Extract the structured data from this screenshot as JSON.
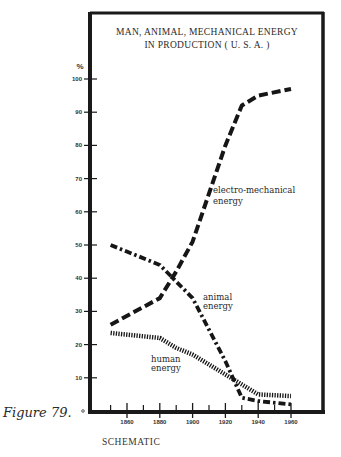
{
  "figure": {
    "caption": "Figure 79.",
    "footnote": "SCHEMATIC"
  },
  "chart_data": {
    "type": "line",
    "title": "MAN, ANIMAL, MECHANICAL ENERGY IN PRODUCTION ( U. S. A. )",
    "title_lines": [
      "MAN, ANIMAL, MECHANICAL ENERGY",
      "IN PRODUCTION ( U. S. A. )"
    ],
    "xlabel": "",
    "ylabel": "%",
    "xlim": [
      1850,
      1960
    ],
    "ylim": [
      0,
      100
    ],
    "x_ticks": [
      1860,
      1880,
      1900,
      1920,
      1940,
      1960
    ],
    "x_minor_ticks": [
      1850,
      1870,
      1890,
      1910,
      1930,
      1950
    ],
    "y_ticks": [
      10,
      20,
      30,
      40,
      50,
      60,
      70,
      80,
      90,
      100
    ],
    "grid": false,
    "x": [
      1850,
      1880,
      1890,
      1900,
      1920,
      1930,
      1940,
      1960
    ],
    "series": [
      {
        "name": "electro-mechanical energy",
        "label_lines": [
          "electro-mechanical",
          "energy"
        ],
        "style": "long-dash",
        "values": [
          26,
          34,
          42,
          51,
          80,
          92,
          95,
          97
        ]
      },
      {
        "name": "animal energy",
        "label_lines": [
          "animal",
          "energy"
        ],
        "style": "dash-dot",
        "values": [
          50,
          44,
          39,
          34,
          15,
          4,
          3,
          2
        ]
      },
      {
        "name": "human energy",
        "label_lines": [
          "human",
          "energy"
        ],
        "style": "dotted",
        "values": [
          23.5,
          22,
          19,
          17,
          11,
          8,
          5,
          4.5
        ]
      }
    ]
  }
}
